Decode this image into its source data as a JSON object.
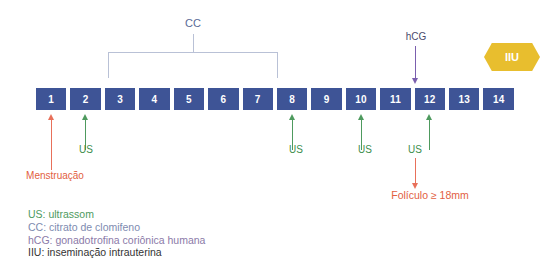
{
  "diagram": {
    "title_hidden": "",
    "timeline": {
      "days": [
        "1",
        "2",
        "3",
        "4",
        "5",
        "6",
        "7",
        "8",
        "9",
        "10",
        "11",
        "12",
        "13",
        "14"
      ],
      "box_color": "#3E5496",
      "box_text_color": "#FFFFFF"
    },
    "cc_bracket": {
      "label": "CC",
      "label_color": "#5A6A96",
      "line_color": "#B9C1D6",
      "spans_days": [
        "3",
        "7"
      ]
    },
    "hcg_marker": {
      "label": "hCG",
      "label_color": "#4B4B6E",
      "arrow_color": "#7B5FAE",
      "points_to_day": "12",
      "direction": "down"
    },
    "iiu_badge": {
      "label": "IIU",
      "fill_color": "#E8BE2E",
      "text_color": "#FFFFFF",
      "shape": "hexagon"
    },
    "markers_below": [
      {
        "name": "menstruacao",
        "label": "Menstruação",
        "color": "#E2603F",
        "arrow_color": "#E8705A",
        "day": "1",
        "direction": "up",
        "stem_height": 50,
        "label_left": 0,
        "label_top": 170,
        "label_width": 110
      },
      {
        "name": "us-day-2",
        "label": "US",
        "color": "#3E8E4E",
        "arrow_color": "#4E9A5E",
        "day": "2",
        "direction": "up",
        "stem_height": 30,
        "label_left": 71,
        "label_top": 144,
        "label_width": 30
      },
      {
        "name": "us-day-8",
        "label": "US",
        "color": "#3E8E4E",
        "arrow_color": "#4E9A5E",
        "day": "8",
        "direction": "up",
        "stem_height": 30,
        "label_left": 281,
        "label_top": 144,
        "label_width": 30
      },
      {
        "name": "us-day-10",
        "label": "US",
        "color": "#3E8E4E",
        "arrow_color": "#4E9A5E",
        "day": "10",
        "direction": "up",
        "stem_height": 30,
        "label_left": 350,
        "label_top": 144,
        "label_width": 30
      },
      {
        "name": "us-day-12",
        "label": "US",
        "color": "#3E8E4E",
        "arrow_color": "#4E9A5E",
        "day": "12",
        "direction": "up",
        "stem_height": 30,
        "label_left": 400,
        "label_top": 144,
        "label_width": 30
      }
    ],
    "foliculo_marker": {
      "label": "Folículo ≥ 18mm",
      "color": "#E2603F",
      "arrow_color": "#E8705A",
      "day": "12",
      "direction": "down"
    },
    "legend": [
      {
        "text": "US: ultrassom",
        "color": "#4E9A5E"
      },
      {
        "text": "CC: citrato de clomifeno",
        "color": "#7E8BB0"
      },
      {
        "text": "hCG: gonadotrofina coriônica humana",
        "color": "#8B7AA8"
      },
      {
        "text": "IIU: inseminação intrauterina",
        "color": "#333333"
      }
    ]
  }
}
